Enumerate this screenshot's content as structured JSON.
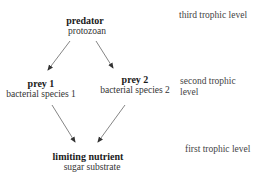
{
  "diagram": {
    "nodes": {
      "predator": {
        "title": "predator",
        "subtitle": "protozoan"
      },
      "prey1": {
        "title": "prey 1",
        "subtitle": "bacterial species 1"
      },
      "prey2": {
        "title": "prey 2",
        "subtitle": "bacterial species 2"
      },
      "nutrient": {
        "title": "limiting nutrient",
        "subtitle": "sugar substrate"
      }
    },
    "levels": {
      "third": "third trophic level",
      "second_line1": "second trophic",
      "second_line2": "level",
      "first": "first trophic level"
    },
    "edges": [
      {
        "from": "predator",
        "to": "prey1"
      },
      {
        "from": "predator",
        "to": "prey2"
      },
      {
        "from": "prey1",
        "to": "nutrient"
      },
      {
        "from": "prey2",
        "to": "nutrient"
      }
    ],
    "colors": {
      "arrow": "#555555",
      "text": "#222222"
    }
  }
}
